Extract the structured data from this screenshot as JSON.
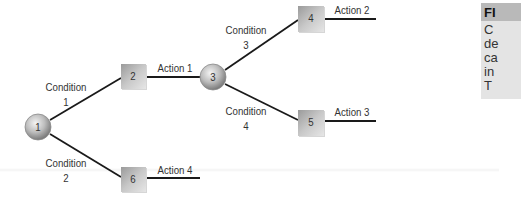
{
  "diagram": {
    "type": "decision-tree",
    "nodes": [
      {
        "id": "1",
        "shape": "circle",
        "label": "1",
        "cx": 38,
        "cy": 127
      },
      {
        "id": "2",
        "shape": "square",
        "label": "2",
        "cx": 133,
        "cy": 76
      },
      {
        "id": "3",
        "shape": "circle",
        "label": "3",
        "cx": 213,
        "cy": 77
      },
      {
        "id": "4",
        "shape": "square",
        "label": "4",
        "cx": 311,
        "cy": 18
      },
      {
        "id": "5",
        "shape": "square",
        "label": "5",
        "cx": 311,
        "cy": 122
      },
      {
        "id": "6",
        "shape": "square",
        "label": "6",
        "cx": 133,
        "cy": 179
      }
    ],
    "edges": [
      {
        "from": "1",
        "to": "2",
        "label_line1": "Condition",
        "label_line2": "1"
      },
      {
        "from": "1",
        "to": "6",
        "label_line1": "Condition",
        "label_line2": "2"
      },
      {
        "from": "2",
        "to": "3",
        "label_line1": "Action 1"
      },
      {
        "from": "3",
        "to": "4",
        "label_line1": "Condition",
        "label_line2": "3"
      },
      {
        "from": "3",
        "to": "5",
        "label_line1": "Condition",
        "label_line2": "4"
      },
      {
        "from": "4",
        "to": "end",
        "label_line1": "Action 2"
      },
      {
        "from": "5",
        "to": "end",
        "label_line1": "Action 3"
      },
      {
        "from": "6",
        "to": "end",
        "label_line1": "Action 4"
      }
    ],
    "labels": {
      "condition1_a": "Condition",
      "condition1_b": "1",
      "condition2_a": "Condition",
      "condition2_b": "2",
      "condition3_a": "Condition",
      "condition3_b": "3",
      "condition4_a": "Condition",
      "condition4_b": "4",
      "action1": "Action 1",
      "action2": "Action 2",
      "action3": "Action 3",
      "action4": "Action 4"
    },
    "colors": {
      "line": "#1a1a1a",
      "node_light": "#e0e0e0",
      "node_dark": "#6e6e6e",
      "text": "#333333"
    }
  },
  "sidebar": {
    "header": "FI",
    "lines": [
      "C",
      "de",
      "ca",
      "in",
      "T"
    ],
    "header_bg": "#b9b9b9",
    "body_bg": "#e4e4e4"
  }
}
